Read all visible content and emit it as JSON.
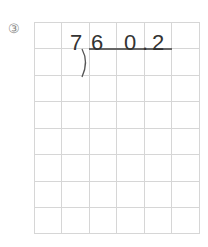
{
  "problem": {
    "number_label": "③",
    "divisor": "7",
    "dividend_digits": [
      "6",
      "0",
      ".",
      "2"
    ]
  }
}
